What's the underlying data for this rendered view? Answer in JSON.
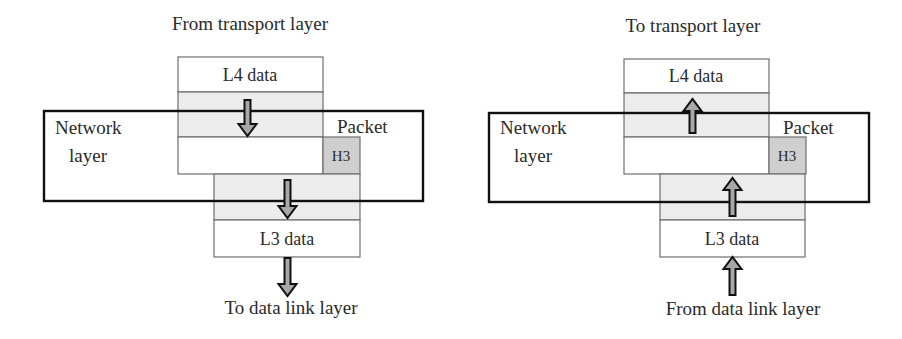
{
  "diagrams": [
    {
      "id": "sending",
      "top_label": "From transport layer",
      "bottom_label": "To data link layer",
      "upper_data_label": "L4 data",
      "lower_data_label": "L3 data",
      "layer_label_line1": "Network",
      "layer_label_line2": "layer",
      "packet_label": "Packet",
      "header_label": "H3",
      "arrow_direction": "down"
    },
    {
      "id": "receiving",
      "top_label": "To transport layer",
      "bottom_label": "From data link layer",
      "upper_data_label": "L4 data",
      "lower_data_label": "L3 data",
      "layer_label_line1": "Network",
      "layer_label_line2": "layer",
      "packet_label": "Packet",
      "header_label": "H3",
      "arrow_direction": "up"
    }
  ],
  "colors": {
    "outline": "#111111",
    "box_border": "#6f6f6f",
    "band_fill": "#ececec",
    "header_fill": "#cfcfcf",
    "arrow_fill": "#a8a8a8",
    "text": "#2a2a2a"
  }
}
